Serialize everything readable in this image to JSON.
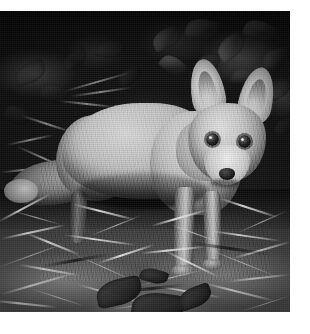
{
  "page": {
    "background_color": "#ffffff",
    "width": 310,
    "height": 334
  },
  "photo": {
    "name": "red-fox-photograph",
    "alt": "Black and white photograph of a young red fox standing in grass in front of dark foliage",
    "subject": "red fox",
    "color_mode": "black-and-white",
    "frame": {
      "x": 0,
      "y": 11,
      "width": 290,
      "height": 301
    },
    "scene": {
      "background": "dark foliage and bramble leaves",
      "midground": "fox standing broadside, head turned toward camera",
      "foreground": "dry grass, straw and dark ivy leaves"
    },
    "palette": {
      "black": "#0a0a0a",
      "shadow": "#1d1d1d",
      "midtone": "#7a7a7a",
      "highlight": "#e6e6e6",
      "white": "#ffffff"
    },
    "fox_parts": [
      {
        "id": "ear-left",
        "label": "Left ear"
      },
      {
        "id": "ear-right",
        "label": "Right ear"
      },
      {
        "id": "eye-left",
        "label": "Left eye"
      },
      {
        "id": "eye-right",
        "label": "Right eye"
      },
      {
        "id": "nose",
        "label": "Nose"
      },
      {
        "id": "muzzle",
        "label": "Muzzle"
      },
      {
        "id": "head",
        "label": "Head"
      },
      {
        "id": "neck",
        "label": "Neck"
      },
      {
        "id": "torso",
        "label": "Torso"
      },
      {
        "id": "rump",
        "label": "Rump"
      },
      {
        "id": "tail",
        "label": "Brush tail"
      },
      {
        "id": "foreleg-near",
        "label": "Near foreleg"
      },
      {
        "id": "foreleg-far",
        "label": "Far foreleg"
      },
      {
        "id": "hindleg",
        "label": "Hind leg"
      }
    ]
  }
}
